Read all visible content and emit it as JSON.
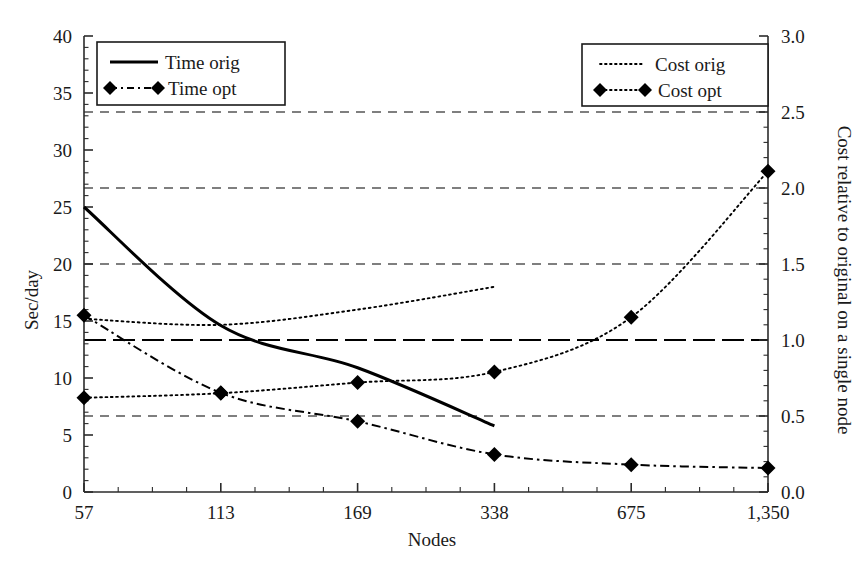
{
  "chart_data": {
    "type": "line",
    "title": "",
    "xlabel": "Nodes",
    "ylabel": "Sec/day",
    "y2label": "Cost relative to original on a single node",
    "categories": [
      "57",
      "113",
      "169",
      "338",
      "675",
      "1,350"
    ],
    "x_tick_labels": [
      "57",
      "113",
      "169",
      "338",
      "675",
      "1,350"
    ],
    "y_tick_labels": [
      "0",
      "5",
      "10",
      "15",
      "20",
      "25",
      "30",
      "35",
      "40"
    ],
    "y_ticks": [
      0,
      5,
      10,
      15,
      20,
      25,
      30,
      35,
      40
    ],
    "ylim": [
      0,
      40
    ],
    "y2_tick_labels": [
      "0.0",
      "0.5",
      "1.0",
      "1.5",
      "2.0",
      "2.5",
      "3.0"
    ],
    "y2_ticks": [
      0.0,
      0.5,
      1.0,
      1.5,
      2.0,
      2.5,
      3.0
    ],
    "y2lim": [
      0,
      3
    ],
    "grid": true,
    "gridlines_y2": [
      0.5,
      1.0,
      1.5,
      2.0,
      2.5
    ],
    "reference_line_y2": 1.0,
    "legend_position": "top-left and top-right",
    "series": [
      {
        "name": "Time orig",
        "axis": "left",
        "style": "solid",
        "marker": "none",
        "x": [
          "57",
          "113",
          "169",
          "338"
        ],
        "values": [
          25.0,
          14.6,
          10.9,
          5.8
        ]
      },
      {
        "name": "Time opt",
        "axis": "left",
        "style": "dash-dot",
        "marker": "diamond",
        "x": [
          "57",
          "113",
          "169",
          "338",
          "675",
          "1,350"
        ],
        "values": [
          15.5,
          8.7,
          6.2,
          3.3,
          2.4,
          2.1
        ]
      },
      {
        "name": "Cost orig",
        "axis": "right",
        "style": "dotted",
        "marker": "none",
        "x": [
          "57",
          "113",
          "169",
          "338"
        ],
        "values": [
          1.14,
          1.1,
          1.2,
          1.35
        ]
      },
      {
        "name": "Cost opt",
        "axis": "right",
        "style": "dotted",
        "marker": "diamond",
        "x": [
          "57",
          "113",
          "169",
          "338",
          "675",
          "1,350"
        ],
        "values": [
          0.62,
          0.65,
          0.72,
          0.79,
          1.15,
          2.11
        ]
      }
    ]
  },
  "legend_left": {
    "entries": [
      {
        "label": "Time orig",
        "style": "solid",
        "marker": "none"
      },
      {
        "label": "Time opt",
        "style": "dash-dot",
        "marker": "diamond"
      }
    ]
  },
  "legend_right": {
    "entries": [
      {
        "label": "Cost orig",
        "style": "dotted",
        "marker": "none"
      },
      {
        "label": "Cost opt",
        "style": "dotted",
        "marker": "diamond"
      }
    ]
  },
  "colors": {
    "line": "#000000",
    "grid": "#000000",
    "axis": "#2b2b2b",
    "background": "#ffffff"
  }
}
